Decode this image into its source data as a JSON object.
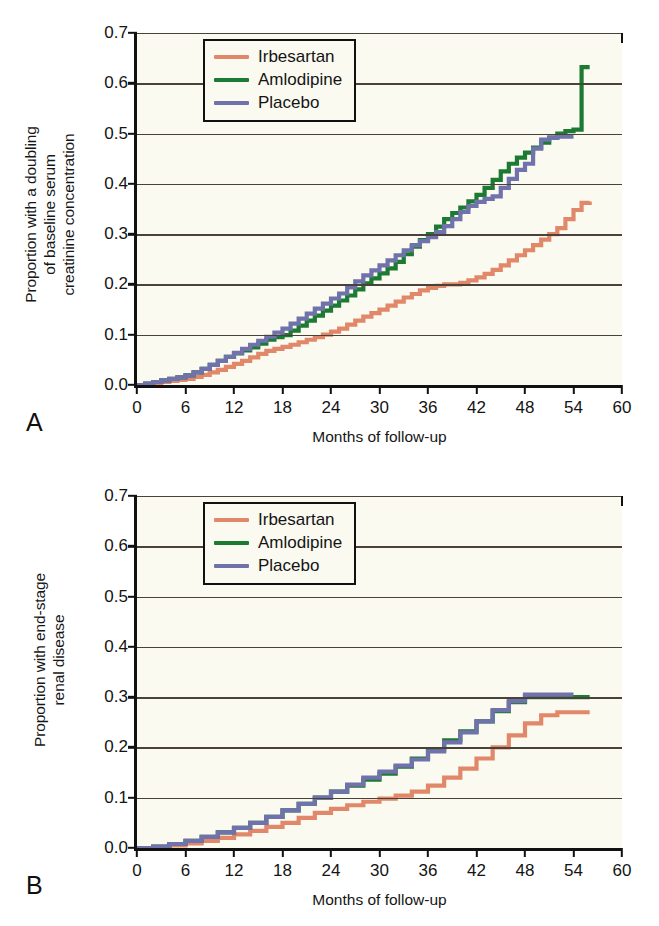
{
  "figure": {
    "panels": [
      {
        "letter": "A",
        "ylabel": "Proportion with a doubling\nof baseline serum\ncreatinine concentration",
        "xlabel": "Months of follow-up"
      },
      {
        "letter": "B",
        "ylabel": "Proportion with end-stage\nrenal disease",
        "xlabel": "Months of follow-up"
      }
    ]
  },
  "legend": {
    "items": [
      {
        "label": "Irbesartan",
        "color": "#e2886a"
      },
      {
        "label": "Amlodipine",
        "color": "#1d7a32"
      },
      {
        "label": "Placebo",
        "color": "#6f72ab"
      }
    ]
  },
  "axes": {
    "yticks": [
      "0.7",
      "0.6",
      "0.5",
      "0.4",
      "0.3",
      "0.2",
      "0.1",
      "0.0"
    ],
    "ytick_values": [
      0.7,
      0.6,
      0.5,
      0.4,
      0.3,
      0.2,
      0.1,
      0.0
    ],
    "xticks": [
      "0",
      "6",
      "12",
      "18",
      "24",
      "30",
      "36",
      "42",
      "48",
      "54",
      "60"
    ],
    "xtick_values": [
      0,
      6,
      12,
      18,
      24,
      30,
      36,
      42,
      48,
      54,
      60
    ],
    "xlim": [
      0,
      60
    ],
    "ylim": [
      0.0,
      0.7
    ],
    "grid": "horizontal"
  },
  "chart_data": [
    {
      "type": "line",
      "title": "",
      "panel": "A",
      "xlabel": "Months of follow-up",
      "ylabel": "Proportion with a doubling of baseline serum creatinine concentration",
      "xlim": [
        0,
        60
      ],
      "ylim": [
        0.0,
        0.7
      ],
      "grid": true,
      "legend_position": "top-left",
      "series": [
        {
          "name": "Irbesartan",
          "color": "#e2886a",
          "x": [
            0,
            1,
            2,
            3,
            4,
            5,
            6,
            7,
            8,
            9,
            10,
            11,
            12,
            13,
            14,
            15,
            16,
            17,
            18,
            19,
            20,
            21,
            22,
            23,
            24,
            25,
            26,
            27,
            28,
            29,
            30,
            31,
            32,
            33,
            34,
            35,
            36,
            37,
            38,
            39,
            40,
            41,
            42,
            43,
            44,
            45,
            46,
            47,
            48,
            49,
            50,
            51,
            52,
            53,
            54,
            55,
            56
          ],
          "y": [
            0.0,
            0.002,
            0.004,
            0.006,
            0.008,
            0.01,
            0.012,
            0.016,
            0.02,
            0.025,
            0.03,
            0.036,
            0.042,
            0.048,
            0.055,
            0.062,
            0.068,
            0.072,
            0.076,
            0.08,
            0.085,
            0.09,
            0.095,
            0.1,
            0.106,
            0.112,
            0.12,
            0.128,
            0.136,
            0.143,
            0.15,
            0.158,
            0.166,
            0.174,
            0.181,
            0.188,
            0.193,
            0.197,
            0.2,
            0.2,
            0.203,
            0.208,
            0.214,
            0.221,
            0.229,
            0.238,
            0.248,
            0.258,
            0.268,
            0.278,
            0.289,
            0.3,
            0.312,
            0.33,
            0.348,
            0.362,
            0.365
          ]
        },
        {
          "name": "Amlodipine",
          "color": "#1d7a32",
          "x": [
            0,
            1,
            2,
            3,
            4,
            5,
            6,
            7,
            8,
            9,
            10,
            11,
            12,
            13,
            14,
            15,
            16,
            17,
            18,
            19,
            20,
            21,
            22,
            23,
            24,
            25,
            26,
            27,
            28,
            29,
            30,
            31,
            32,
            33,
            34,
            35,
            36,
            37,
            38,
            39,
            40,
            41,
            42,
            43,
            44,
            45,
            46,
            47,
            48,
            49,
            50,
            51,
            52,
            53,
            54,
            55,
            56
          ],
          "y": [
            0.0,
            0.003,
            0.006,
            0.009,
            0.012,
            0.015,
            0.019,
            0.025,
            0.032,
            0.04,
            0.048,
            0.056,
            0.063,
            0.069,
            0.075,
            0.082,
            0.09,
            0.095,
            0.099,
            0.108,
            0.118,
            0.128,
            0.138,
            0.148,
            0.158,
            0.168,
            0.178,
            0.19,
            0.202,
            0.212,
            0.222,
            0.232,
            0.245,
            0.26,
            0.275,
            0.288,
            0.3,
            0.315,
            0.33,
            0.342,
            0.353,
            0.365,
            0.378,
            0.392,
            0.408,
            0.425,
            0.44,
            0.452,
            0.462,
            0.472,
            0.482,
            0.492,
            0.5,
            0.505,
            0.508,
            0.632,
            0.632
          ]
        },
        {
          "name": "Placebo",
          "color": "#6f72ab",
          "x": [
            0,
            1,
            2,
            3,
            4,
            5,
            6,
            7,
            8,
            9,
            10,
            11,
            12,
            13,
            14,
            15,
            16,
            17,
            18,
            19,
            20,
            21,
            22,
            23,
            24,
            25,
            26,
            27,
            28,
            29,
            30,
            31,
            32,
            33,
            34,
            35,
            36,
            37,
            38,
            39,
            40,
            41,
            42,
            43,
            44,
            45,
            46,
            47,
            48,
            49,
            50,
            51,
            52,
            53,
            54
          ],
          "y": [
            0.0,
            0.003,
            0.006,
            0.009,
            0.012,
            0.015,
            0.019,
            0.025,
            0.032,
            0.04,
            0.048,
            0.056,
            0.064,
            0.072,
            0.08,
            0.088,
            0.096,
            0.104,
            0.112,
            0.122,
            0.132,
            0.142,
            0.152,
            0.162,
            0.172,
            0.182,
            0.194,
            0.206,
            0.218,
            0.228,
            0.238,
            0.248,
            0.258,
            0.268,
            0.278,
            0.286,
            0.294,
            0.304,
            0.316,
            0.33,
            0.344,
            0.356,
            0.364,
            0.37,
            0.375,
            0.392,
            0.41,
            0.428,
            0.44,
            0.47,
            0.488,
            0.492,
            0.494,
            0.494,
            0.494
          ]
        }
      ]
    },
    {
      "type": "line",
      "title": "",
      "panel": "B",
      "xlabel": "Months of follow-up",
      "ylabel": "Proportion with end-stage renal disease",
      "xlim": [
        0,
        60
      ],
      "ylim": [
        0.0,
        0.7
      ],
      "grid": true,
      "legend_position": "top-left",
      "series": [
        {
          "name": "Irbesartan",
          "color": "#e2886a",
          "x": [
            0,
            2,
            4,
            6,
            8,
            10,
            12,
            14,
            16,
            18,
            20,
            22,
            24,
            26,
            28,
            30,
            32,
            34,
            36,
            38,
            40,
            42,
            44,
            46,
            48,
            50,
            52,
            54,
            56
          ],
          "y": [
            0.0,
            0.002,
            0.005,
            0.009,
            0.014,
            0.02,
            0.027,
            0.034,
            0.042,
            0.05,
            0.06,
            0.07,
            0.078,
            0.085,
            0.092,
            0.098,
            0.104,
            0.112,
            0.124,
            0.14,
            0.158,
            0.178,
            0.2,
            0.224,
            0.248,
            0.264,
            0.27,
            0.27,
            0.27
          ]
        },
        {
          "name": "Amlodipine",
          "color": "#1d7a32",
          "x": [
            0,
            2,
            4,
            6,
            8,
            10,
            12,
            14,
            16,
            18,
            20,
            22,
            24,
            26,
            28,
            30,
            32,
            34,
            36,
            38,
            40,
            42,
            44,
            46,
            48,
            50,
            52,
            54,
            56
          ],
          "y": [
            0.0,
            0.003,
            0.008,
            0.014,
            0.022,
            0.031,
            0.04,
            0.05,
            0.062,
            0.075,
            0.088,
            0.1,
            0.112,
            0.124,
            0.136,
            0.148,
            0.162,
            0.178,
            0.196,
            0.214,
            0.232,
            0.252,
            0.272,
            0.29,
            0.3,
            0.3,
            0.3,
            0.3,
            0.3
          ]
        },
        {
          "name": "Placebo",
          "color": "#6f72ab",
          "x": [
            0,
            2,
            4,
            6,
            8,
            10,
            12,
            14,
            16,
            18,
            20,
            22,
            24,
            26,
            28,
            30,
            32,
            34,
            36,
            38,
            40,
            42,
            44,
            46,
            48,
            50,
            52,
            54
          ],
          "y": [
            0.0,
            0.003,
            0.008,
            0.014,
            0.022,
            0.031,
            0.04,
            0.05,
            0.062,
            0.075,
            0.088,
            0.1,
            0.112,
            0.126,
            0.14,
            0.152,
            0.164,
            0.176,
            0.192,
            0.21,
            0.23,
            0.252,
            0.274,
            0.292,
            0.305,
            0.305,
            0.305,
            0.305
          ]
        }
      ]
    }
  ]
}
